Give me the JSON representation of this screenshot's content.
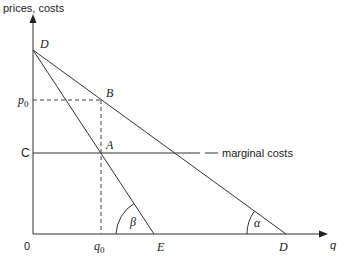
{
  "axes": {
    "y_label": "prices, costs",
    "x_label": "q",
    "origin": "0"
  },
  "points": {
    "D_top": "D",
    "B": "B",
    "A": "A",
    "C": "C",
    "E": "E",
    "D_right": "D",
    "p0": "p",
    "p0_sub": "0",
    "q0": "q",
    "q0_sub": "0"
  },
  "lines": {
    "marginal_costs": "marginal costs"
  },
  "angles": {
    "alpha": "α",
    "beta": "β"
  },
  "colors": {
    "line": "#333333",
    "text": "#222222"
  }
}
